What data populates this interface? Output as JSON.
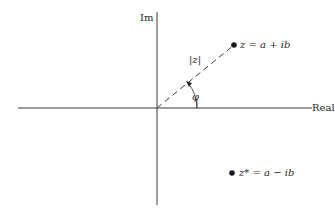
{
  "diagram": {
    "type": "complex-plane",
    "axes": {
      "horizontal_label": "Real",
      "vertical_label": "Im"
    },
    "points": [
      {
        "id": "z",
        "label": "z = a + ib"
      },
      {
        "id": "z_conjugate",
        "label": "z* = a − ib"
      }
    ],
    "annotations": {
      "magnitude": "|z|",
      "angle": "φ"
    },
    "colors": {
      "ink": "#2a2a2a",
      "background": "#ffffff"
    }
  }
}
